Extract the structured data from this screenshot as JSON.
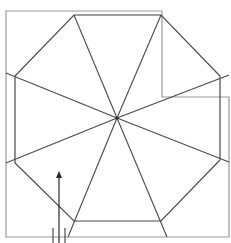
{
  "diagram": {
    "title": "",
    "colors": {
      "background": "#ffffff",
      "frame": "#9a9a9a",
      "octagon": "#4a4a4a",
      "arrow": "#2a2a2a"
    },
    "center": [
      117,
      118
    ],
    "octagon_vertices": [
      [
        74,
        15
      ],
      [
        161,
        15
      ],
      [
        220,
        76
      ],
      [
        220,
        160
      ],
      [
        161,
        221
      ],
      [
        74,
        221
      ],
      [
        15,
        163
      ],
      [
        15,
        76
      ]
    ],
    "frame_paths": [
      "M6 11 L162 11 L162 97 L229 97 L229 237 L6 237 Z"
    ],
    "arrow": {
      "x": 59,
      "y1": 243,
      "y2": 173
    },
    "ticks": [
      {
        "x": 53,
        "y1": 228,
        "y2": 243
      },
      {
        "x": 65,
        "y1": 228,
        "y2": 243
      }
    ]
  }
}
